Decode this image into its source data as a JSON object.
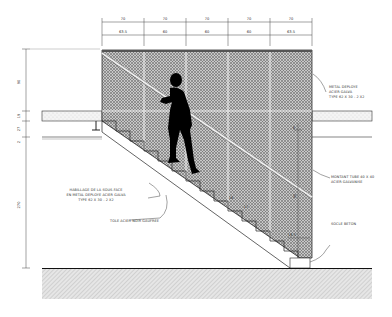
{
  "drawing": {
    "title": "Stair section elevation",
    "top_dimensions": {
      "upper_row": [
        "70",
        "70",
        "70",
        "70",
        "70"
      ],
      "lower_row": [
        "63.5",
        "60",
        "60",
        "60",
        "63.5"
      ]
    },
    "left_dimensions": [
      "90",
      "19",
      "27",
      "2",
      "270"
    ],
    "inner_dimensions": {
      "upper_right": "6",
      "mid_right": "90",
      "lower_right": "16.5",
      "step_a": "16",
      "step_b": "17"
    },
    "annotations": {
      "mesh_panel": [
        "METAL DEPLOYE",
        "ACIER GALVA",
        "TYPE 62 X 30 - 2 X2"
      ],
      "post": [
        "MONTANT TUBE 40 X 40",
        "ACIER GALVANISE"
      ],
      "base": [
        "SOCLE BETON"
      ],
      "soffit": [
        "HABILLAGE DE LA SOUS-FACE",
        "EN METAL DEPLOYE ACIER GALVA",
        "TYPE 62 X 30 - 2 X2"
      ],
      "tread": [
        "TOLE ACIER NOIR GAUFREE"
      ]
    }
  }
}
